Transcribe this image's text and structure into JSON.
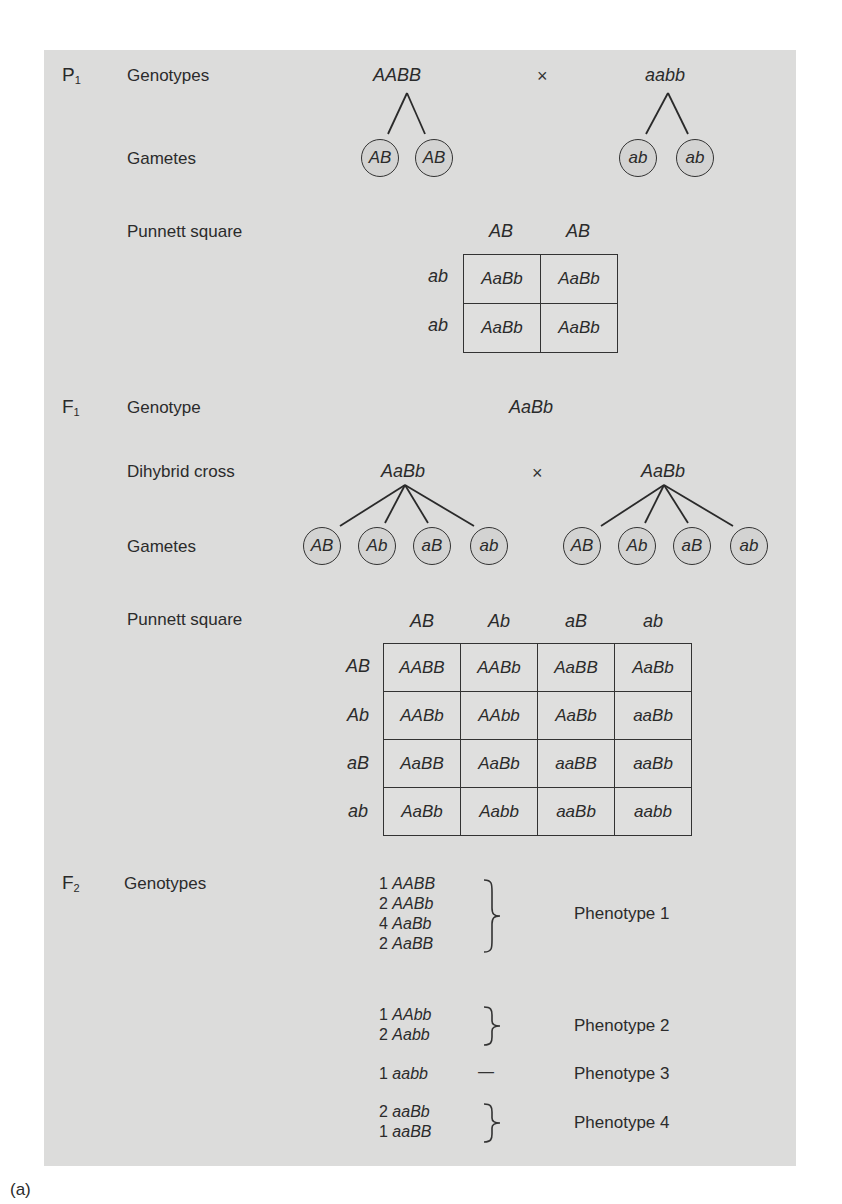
{
  "p1": {
    "generation": "P",
    "generation_sub": "1",
    "genotypes_label": "Genotypes",
    "parent1": "AABB",
    "cross_symbol": "×",
    "parent2": "aabb",
    "gametes_label": "Gametes",
    "parent1_gametes": [
      "AB",
      "AB"
    ],
    "parent2_gametes": [
      "ab",
      "ab"
    ],
    "punnett_label": "Punnett square",
    "punnett": {
      "col_headers": [
        "AB",
        "AB"
      ],
      "row_headers": [
        "ab",
        "ab"
      ],
      "cells": [
        [
          "AaBb",
          "AaBb"
        ],
        [
          "AaBb",
          "AaBb"
        ]
      ]
    }
  },
  "f1": {
    "generation": "F",
    "generation_sub": "1",
    "genotype_label": "Genotype",
    "genotype": "AaBb",
    "dihybrid_label": "Dihybrid cross",
    "parent1": "AaBb",
    "cross_symbol": "×",
    "parent2": "AaBb",
    "gametes_label": "Gametes",
    "parent1_gametes": [
      "AB",
      "Ab",
      "aB",
      "ab"
    ],
    "parent2_gametes": [
      "AB",
      "Ab",
      "aB",
      "ab"
    ],
    "punnett_label": "Punnett square",
    "punnett": {
      "col_headers": [
        "AB",
        "Ab",
        "aB",
        "ab"
      ],
      "row_headers": [
        "AB",
        "Ab",
        "aB",
        "ab"
      ],
      "cells": [
        [
          "AABB",
          "AABb",
          "AaBB",
          "AaBb"
        ],
        [
          "AABb",
          "AAbb",
          "AaBb",
          "aaBb"
        ],
        [
          "AaBB",
          "AaBb",
          "aaBB",
          "aaBb"
        ],
        [
          "AaBb",
          "Aabb",
          "aaBb",
          "aabb"
        ]
      ]
    }
  },
  "f2": {
    "generation": "F",
    "generation_sub": "2",
    "genotypes_label": "Genotypes",
    "groups": [
      {
        "items": [
          {
            "count": "1",
            "genotype": "AABB"
          },
          {
            "count": "2",
            "genotype": "AABb"
          },
          {
            "count": "4",
            "genotype": "AaBb"
          },
          {
            "count": "2",
            "genotype": "AaBB"
          }
        ],
        "connector": "}",
        "phenotype": "Phenotype 1"
      },
      {
        "items": [
          {
            "count": "1",
            "genotype": "AAbb"
          },
          {
            "count": "2",
            "genotype": "Aabb"
          }
        ],
        "connector": "}",
        "phenotype": "Phenotype 2"
      },
      {
        "items": [
          {
            "count": "1",
            "genotype": "aabb"
          }
        ],
        "connector": "—",
        "phenotype": "Phenotype 3"
      },
      {
        "items": [
          {
            "count": "2",
            "genotype": "aaBb"
          },
          {
            "count": "1",
            "genotype": "aaBB"
          }
        ],
        "connector": "}",
        "phenotype": "Phenotype 4"
      }
    ]
  },
  "caption": "(a)"
}
